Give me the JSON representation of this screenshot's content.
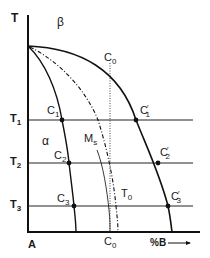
{
  "diagram": {
    "type": "phase-diagram",
    "axis": {
      "y_label": "T",
      "x_origin_label": "A",
      "x_label": "%B",
      "x_arrow": "→"
    },
    "phases": {
      "upper": "β",
      "left": "α"
    },
    "curves": {
      "ms": {
        "label": "M",
        "sub": "s"
      },
      "t0": {
        "label": "T",
        "sub": "0"
      }
    },
    "composition": {
      "top": {
        "label": "C",
        "sub": "0"
      },
      "bottom": {
        "label": "C",
        "sub": "0"
      }
    },
    "temperatures": [
      {
        "label": "T",
        "sub": "1"
      },
      {
        "label": "T",
        "sub": "2"
      },
      {
        "label": "T",
        "sub": "3"
      }
    ],
    "points_left": [
      {
        "label": "C",
        "sub": "1"
      },
      {
        "label": "C",
        "sub": "2"
      },
      {
        "label": "C",
        "sub": "3"
      }
    ],
    "points_right": [
      {
        "label": "C",
        "sub": "1",
        "prime": "′"
      },
      {
        "label": "C",
        "sub": "2",
        "prime": "′"
      },
      {
        "label": "C",
        "sub": "3",
        "prime": "′"
      }
    ],
    "colors": {
      "line": "#111111",
      "background": "#ffffff"
    }
  }
}
